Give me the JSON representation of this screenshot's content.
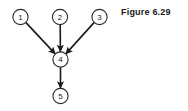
{
  "figure": {
    "caption": "Figure 6.29"
  },
  "diagram": {
    "type": "directed-graph",
    "nodes": [
      {
        "id": "1",
        "label": "1",
        "cx": 20.5,
        "cy": 17,
        "r": 7.6
      },
      {
        "id": "2",
        "label": "2",
        "cx": 60.0,
        "cy": 17,
        "r": 7.6
      },
      {
        "id": "3",
        "label": "3",
        "cx": 99.5,
        "cy": 17,
        "r": 7.6
      },
      {
        "id": "4",
        "label": "4",
        "cx": 60.5,
        "cy": 59.5,
        "r": 7.6
      },
      {
        "id": "5",
        "label": "5",
        "cx": 60.5,
        "cy": 96.0,
        "r": 7.6
      }
    ],
    "edges": [
      {
        "from": "1",
        "to": "4",
        "x1": 26.0,
        "y1": 22.6,
        "x2": 55.2,
        "y2": 53.9
      },
      {
        "from": "2",
        "to": "4",
        "x1": 60.2,
        "y1": 24.6,
        "x2": 60.4,
        "y2": 51.5
      },
      {
        "from": "3",
        "to": "4",
        "x1": 94.0,
        "y1": 22.6,
        "x2": 65.8,
        "y2": 53.9
      },
      {
        "from": "4",
        "to": "5",
        "x1": 60.5,
        "y1": 67.3,
        "x2": 60.5,
        "y2": 88.0
      }
    ],
    "colors": {
      "node_stroke": "#2b2b2b",
      "node_fill": "#ffffff",
      "edge": "#1a1a1a",
      "text": "#1a1a1a",
      "background": "#ffffff"
    }
  }
}
